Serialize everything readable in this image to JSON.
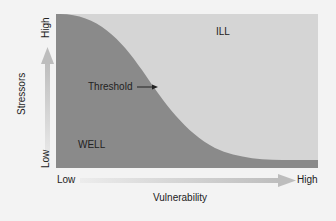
{
  "diagram": {
    "type": "diathesis-stress threshold diagram",
    "y_axis": {
      "title": "Stressors",
      "low_label": "Low",
      "high_label": "High"
    },
    "x_axis": {
      "title": "Vulnerability",
      "low_label": "Low",
      "high_label": "High"
    },
    "regions": {
      "upper": {
        "label": "ILL",
        "color": "#d5d5d5"
      },
      "lower": {
        "label": "WELL",
        "color": "#8a8a8a"
      }
    },
    "curve": {
      "label": "Threshold"
    },
    "colors": {
      "background": "#f3f3f3",
      "arrow": "#c4c4c4",
      "text": "#222222"
    }
  }
}
